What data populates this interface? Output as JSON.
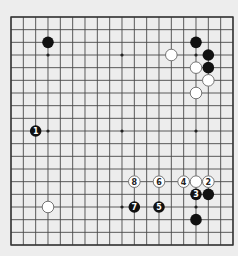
{
  "board": {
    "size": 19,
    "origin": {
      "x": 11,
      "y": 17
    },
    "spacing": {
      "x": 12.333,
      "y": 12.667
    },
    "background": "#ededed",
    "line_color": "#4a4a4a",
    "star_points": [
      [
        3,
        3
      ],
      [
        9,
        3
      ],
      [
        15,
        3
      ],
      [
        3,
        9
      ],
      [
        9,
        9
      ],
      [
        15,
        9
      ],
      [
        3,
        15
      ],
      [
        9,
        15
      ],
      [
        15,
        15
      ]
    ]
  },
  "stones": [
    {
      "color": "black",
      "col": 3,
      "row": 2,
      "label": ""
    },
    {
      "color": "black",
      "col": 15,
      "row": 2,
      "label": ""
    },
    {
      "color": "white",
      "col": 13,
      "row": 3,
      "label": ""
    },
    {
      "color": "black",
      "col": 16,
      "row": 3,
      "label": ""
    },
    {
      "color": "white",
      "col": 15,
      "row": 4,
      "label": ""
    },
    {
      "color": "black",
      "col": 16,
      "row": 4,
      "label": ""
    },
    {
      "color": "white",
      "col": 16,
      "row": 5,
      "label": ""
    },
    {
      "color": "white",
      "col": 15,
      "row": 6,
      "label": ""
    },
    {
      "color": "black",
      "col": 2,
      "row": 9,
      "label": "1"
    },
    {
      "color": "white",
      "col": 10,
      "row": 13,
      "label": "8"
    },
    {
      "color": "white",
      "col": 12,
      "row": 13,
      "label": "6"
    },
    {
      "color": "white",
      "col": 14,
      "row": 13,
      "label": "4"
    },
    {
      "color": "white",
      "col": 15,
      "row": 13,
      "label": ""
    },
    {
      "color": "white",
      "col": 16,
      "row": 13,
      "label": "2"
    },
    {
      "color": "black",
      "col": 15,
      "row": 14,
      "label": "3"
    },
    {
      "color": "black",
      "col": 16,
      "row": 14,
      "label": ""
    },
    {
      "color": "white",
      "col": 3,
      "row": 15,
      "label": ""
    },
    {
      "color": "black",
      "col": 10,
      "row": 15,
      "label": "7"
    },
    {
      "color": "black",
      "col": 12,
      "row": 15,
      "label": "5"
    },
    {
      "color": "black",
      "col": 15,
      "row": 16,
      "label": ""
    }
  ]
}
